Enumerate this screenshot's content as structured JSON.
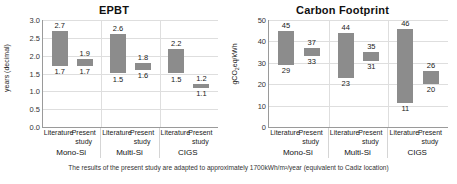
{
  "footnote": "The results of the present study are adapted to approximately 1700kWh/m²/year (equivalent to Cadiz location)",
  "panels": [
    {
      "id": "epbt",
      "title": "EPBT",
      "ylabel": "years (decimal)",
      "yticks": [
        "0.0",
        "0.5",
        "1.0",
        "1.5",
        "2.0",
        "2.5",
        "3.0"
      ],
      "groups": [
        "Mono-Si",
        "Multi-Si",
        "CIGS"
      ],
      "series_labels": [
        "Literature",
        "Present study"
      ],
      "bars": [
        {
          "group": "Mono-Si",
          "series": "Literature",
          "low": 1.7,
          "high": 2.7,
          "low_label": "1.7",
          "high_label": "2.7"
        },
        {
          "group": "Mono-Si",
          "series": "Present study",
          "low": 1.7,
          "high": 1.9,
          "low_label": "1.7",
          "high_label": "1.9"
        },
        {
          "group": "Multi-Si",
          "series": "Literature",
          "low": 1.5,
          "high": 2.6,
          "low_label": "1.5",
          "high_label": "2.6"
        },
        {
          "group": "Multi-Si",
          "series": "Present study",
          "low": 1.6,
          "high": 1.8,
          "low_label": "1.6",
          "high_label": "1.8"
        },
        {
          "group": "CIGS",
          "series": "Literature",
          "low": 1.5,
          "high": 2.2,
          "low_label": "1.5",
          "high_label": "2.2"
        },
        {
          "group": "CIGS",
          "series": "Present study",
          "low": 1.1,
          "high": 1.2,
          "low_label": "1.1",
          "high_label": "1.2"
        }
      ]
    },
    {
      "id": "cf",
      "title": "Carbon Footprint",
      "ylabel": "gCO2eq/kWh",
      "yticks": [
        "0",
        "10",
        "20",
        "30",
        "40",
        "50"
      ],
      "groups": [
        "Mono-Si",
        "Multi-Si",
        "CIGS"
      ],
      "series_labels": [
        "Literature",
        "Present study"
      ],
      "bars": [
        {
          "group": "Mono-Si",
          "series": "Literature",
          "low": 29,
          "high": 45,
          "low_label": "29",
          "high_label": "45"
        },
        {
          "group": "Mono-Si",
          "series": "Present study",
          "low": 33,
          "high": 37,
          "low_label": "33",
          "high_label": "37"
        },
        {
          "group": "Multi-Si",
          "series": "Literature",
          "low": 23,
          "high": 44,
          "low_label": "23",
          "high_label": "44"
        },
        {
          "group": "Multi-Si",
          "series": "Present study",
          "low": 31,
          "high": 35,
          "low_label": "31",
          "high_label": "35"
        },
        {
          "group": "CIGS",
          "series": "Literature",
          "low": 11,
          "high": 46,
          "low_label": "11",
          "high_label": "46"
        },
        {
          "group": "CIGS",
          "series": "Present study",
          "low": 20,
          "high": 26,
          "low_label": "20",
          "high_label": "26"
        }
      ]
    }
  ],
  "chart_data": [
    {
      "type": "bar",
      "subtype": "floating-range-bar",
      "title": "EPBT",
      "xlabel": "",
      "ylabel": "years (decimal)",
      "ylim": [
        0.0,
        3.0
      ],
      "ytick_step": 0.5,
      "grid": true,
      "legend": "none",
      "categories": [
        "Mono-Si Literature",
        "Mono-Si Present study",
        "Multi-Si Literature",
        "Multi-Si Present study",
        "CIGS Literature",
        "CIGS Present study"
      ],
      "groups": [
        "Mono-Si",
        "Multi-Si",
        "CIGS"
      ],
      "series": [
        {
          "name": "low",
          "values": [
            1.7,
            1.7,
            1.5,
            1.6,
            1.5,
            1.1
          ]
        },
        {
          "name": "high",
          "values": [
            2.7,
            1.9,
            2.6,
            1.8,
            2.2,
            1.2
          ]
        }
      ],
      "bar_color": "#8c8c8c"
    },
    {
      "type": "bar",
      "subtype": "floating-range-bar",
      "title": "Carbon Footprint",
      "xlabel": "",
      "ylabel": "gCO2eq/kWh",
      "ylim": [
        0,
        50
      ],
      "ytick_step": 10,
      "grid": true,
      "legend": "none",
      "categories": [
        "Mono-Si Literature",
        "Mono-Si Present study",
        "Multi-Si Literature",
        "Multi-Si Present study",
        "CIGS Literature",
        "CIGS Present study"
      ],
      "groups": [
        "Mono-Si",
        "Multi-Si",
        "CIGS"
      ],
      "series": [
        {
          "name": "low",
          "values": [
            29,
            33,
            23,
            31,
            11,
            20
          ]
        },
        {
          "name": "high",
          "values": [
            45,
            37,
            44,
            35,
            46,
            26
          ]
        }
      ],
      "bar_color": "#8c8c8c"
    }
  ]
}
